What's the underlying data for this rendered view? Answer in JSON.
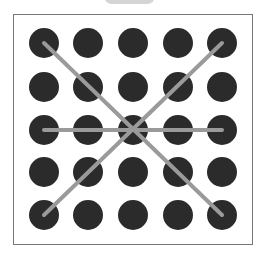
{
  "pattern_lock": {
    "grid_size": 5,
    "colors": {
      "dot": "#2b2b2b",
      "line": "#9a9a9a",
      "border": "#777777",
      "tab": "#d4d4d4"
    },
    "columns_x": [
      44,
      88,
      133,
      178,
      222
    ],
    "rows_y": [
      43,
      87,
      130,
      172,
      215
    ],
    "dot_radius": 15,
    "strokes": [
      {
        "from": [
          0,
          0
        ],
        "to": [
          4,
          4
        ]
      },
      {
        "from": [
          4,
          0
        ],
        "to": [
          0,
          4
        ]
      },
      {
        "from": [
          0,
          2
        ],
        "to": [
          4,
          2
        ]
      }
    ]
  }
}
